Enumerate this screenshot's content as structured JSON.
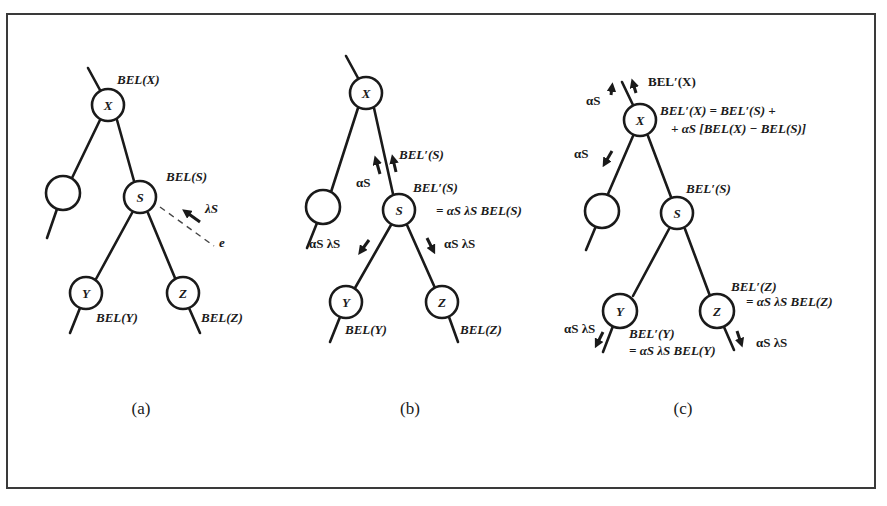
{
  "figure": {
    "panels": [
      {
        "caption": "(a)",
        "nodes": {
          "X": {
            "label": "X",
            "belief": "BEL(X)"
          },
          "left": {
            "label": ""
          },
          "S": {
            "label": "S",
            "belief": "BEL(S)"
          },
          "Y": {
            "label": "Y",
            "belief": "BEL(Y)"
          },
          "Z": {
            "label": "Z",
            "belief": "BEL(Z)"
          }
        },
        "evidence": {
          "message": "λS",
          "label": "e"
        }
      },
      {
        "caption": "(b)",
        "nodes": {
          "X": {
            "label": "X"
          },
          "left": {
            "label": ""
          },
          "S": {
            "label": "S",
            "belief_line1": "BEL′(S)",
            "belief_line2": "= αS λS BEL(S)"
          },
          "Y": {
            "label": "Y",
            "belief": "BEL(Y)"
          },
          "Z": {
            "label": "Z",
            "belief": "BEL(Z)"
          }
        },
        "messages": {
          "up_alpha": "αS",
          "up_bel": "BEL′(S)",
          "left_down": "αS λS",
          "right_down": "αS λS"
        }
      },
      {
        "caption": "(c)",
        "nodes": {
          "X": {
            "label": "X",
            "belief_line1": "BEL′(X) = BEL′(S) +",
            "belief_line2": "+ αS [BEL(X) − BEL(S)]"
          },
          "left": {
            "label": ""
          },
          "S": {
            "label": "S",
            "belief": "BEL′(S)"
          },
          "Y": {
            "label": "Y",
            "belief_line1": "BEL′(Y)",
            "belief_line2": "= αS λS BEL(Y)"
          },
          "Z": {
            "label": "Z",
            "belief_line1": "BEL′(Z)",
            "belief_line2": "= αS λS BEL(Z)"
          }
        },
        "messages": {
          "top_alpha": "αS",
          "top_bel": "BEL′(X)",
          "left_alpha": "αS",
          "y_msg": "αS λS",
          "z_msg": "αS λS"
        }
      }
    ]
  }
}
